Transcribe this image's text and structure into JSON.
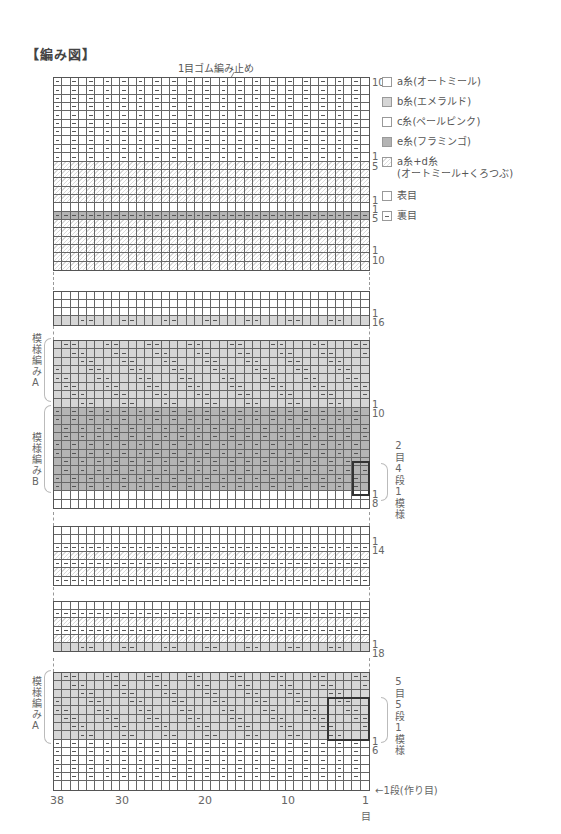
{
  "title": "【編み図】",
  "top_note": "1目ゴム編み止め",
  "legend": [
    {
      "key": "a",
      "label": "a糸(オートミール)",
      "swatch": "#ffffff",
      "symbol": "none"
    },
    {
      "key": "b",
      "label": "b糸(エメラルド)",
      "swatch": "#d6d6d6",
      "symbol": "none"
    },
    {
      "key": "c",
      "label": "c糸(ペールピンク)",
      "swatch": "#ffffff",
      "symbol": "none"
    },
    {
      "key": "e",
      "label": "e糸(フラミンゴ)",
      "swatch": "#b4b4b4",
      "symbol": "none"
    },
    {
      "key": "ad",
      "label": "a糸+d糸",
      "label2": "(オートミール+くろつぶ)",
      "swatch": "hatch",
      "symbol": "none"
    },
    {
      "key": "knit",
      "label": "表目",
      "swatch": "#ffffff",
      "symbol": "none"
    },
    {
      "key": "purl",
      "label": "裏目",
      "swatch": "#ffffff",
      "symbol": "purl"
    }
  ],
  "row_labels": [
    {
      "text": "10",
      "top": 78
    },
    {
      "text": "1",
      "top": 152
    },
    {
      "text": "5",
      "top": 162
    },
    {
      "text": "1",
      "top": 196
    },
    {
      "text": "1",
      "top": 205
    },
    {
      "text": "5",
      "top": 214
    },
    {
      "text": "1",
      "top": 246
    },
    {
      "text": "10",
      "top": 256
    },
    {
      "text": "1",
      "top": 309
    },
    {
      "text": "16",
      "top": 318
    },
    {
      "text": "1",
      "top": 400
    },
    {
      "text": "10",
      "top": 409
    },
    {
      "text": "1",
      "top": 490
    },
    {
      "text": "8",
      "top": 499
    },
    {
      "text": "1",
      "top": 537
    },
    {
      "text": "14",
      "top": 546
    },
    {
      "text": "1",
      "top": 640
    },
    {
      "text": "18",
      "top": 649
    },
    {
      "text": "1",
      "top": 737
    },
    {
      "text": "6",
      "top": 746
    }
  ],
  "side_labels": [
    {
      "text": "模様編みA",
      "top": 333
    },
    {
      "text": "模様編みB",
      "top": 432
    },
    {
      "text": "模様編みA",
      "top": 676
    }
  ],
  "repeat_notes": [
    {
      "text": "2目4段1模様",
      "top": 440
    },
    {
      "text": "5目5段1模様",
      "top": 676
    }
  ],
  "x_axis": {
    "ticks": [
      {
        "text": "38",
        "left": 50
      },
      {
        "text": "30",
        "left": 115
      },
      {
        "text": "20",
        "left": 198
      },
      {
        "text": "10",
        "left": 281
      },
      {
        "text": "1",
        "left": 362
      }
    ],
    "unit": "目"
  },
  "cast_on_label": "←1段(作り目)",
  "chart_data": {
    "type": "table",
    "stitches": 38,
    "stitch_ticks": [
      38,
      30,
      20,
      10,
      1
    ],
    "sections_bottom_to_top": [
      {
        "name": "cast-on",
        "rows": 1,
        "color": "a",
        "purl_rule": "none"
      },
      {
        "name": "1目ゴム編み",
        "rows": 5,
        "color": "a",
        "purl_rule": "even stitches"
      },
      {
        "name": "模様編みA",
        "rows": 8,
        "color": "b",
        "repeat": "5目5段1模様",
        "purl_rule": "diagonal pairs"
      },
      {
        "name": "gap (omitted)",
        "rows": 0
      },
      {
        "name": "a+d stripe",
        "rows": 18,
        "color": "ad/a",
        "purl_rule": "every other row all-purl"
      },
      {
        "name": "gap (omitted)",
        "rows": 0
      },
      {
        "name": "a+d stripe",
        "rows": 14,
        "color": "ad/a",
        "purl_rule": "every other row all-purl"
      },
      {
        "name": "gap (omitted)",
        "rows": 0
      },
      {
        "name": "plain",
        "rows": 2,
        "color": "a",
        "purl_rule": "none"
      },
      {
        "name": "模様編みB",
        "rows": 10,
        "color": "e",
        "repeat": "2目4段1模様",
        "purl_rule": "seed offset"
      },
      {
        "name": "模様編みA",
        "rows": 8,
        "color": "b",
        "purl_rule": "diagonal pairs"
      },
      {
        "name": "gap (omitted)",
        "rows": 0
      },
      {
        "name": "模様編みA",
        "rows": 1,
        "color": "b",
        "row_label": 16
      },
      {
        "name": "plain",
        "rows": 3,
        "color": "a"
      },
      {
        "name": "gap (omitted)",
        "rows": 0
      },
      {
        "name": "a+d",
        "rows": 10,
        "color": "ad/a"
      },
      {
        "name": "e purl row",
        "rows": 1,
        "color": "e",
        "purl_rule": "all"
      },
      {
        "name": "a+d",
        "rows": 5,
        "color": "ad/a"
      },
      {
        "name": "1目ゴム編み",
        "rows": 10,
        "color": "a",
        "purl_rule": "even stitches"
      }
    ]
  }
}
